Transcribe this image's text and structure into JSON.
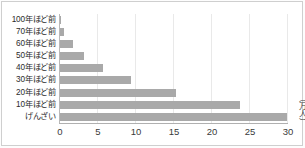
{
  "chart_data": {
    "type": "bar",
    "orientation": "horizontal",
    "title": "",
    "xlabel": "",
    "ylabel": "",
    "unit_label": "（万人）",
    "categories": [
      "100年ほど前",
      "70年ほど前",
      "60年ほど前",
      "50年ほど前",
      "40年ほど前",
      "30年ほど前",
      "20年ほど前",
      "10年ほど前",
      "げんざい"
    ],
    "values": [
      0.1,
      0.5,
      1.7,
      3.1,
      5.7,
      9.4,
      15.3,
      23.7,
      29.9
    ],
    "xlim": [
      0,
      30
    ],
    "xticks": [
      0,
      5,
      10,
      15,
      20,
      25,
      30
    ],
    "xtick_labels": [
      "0",
      "5",
      "10",
      "15",
      "20",
      "25",
      "30"
    ],
    "grid": true,
    "legend": false,
    "bar_color": "#a9a9a9",
    "gridline_color": "#e9e9e9",
    "axis_color": "#b0b0b0",
    "background_color": "#ffffff"
  }
}
